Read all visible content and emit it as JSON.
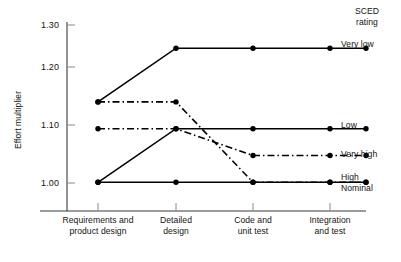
{
  "chart_data": {
    "type": "line",
    "title": "",
    "xlabel": "",
    "ylabel": "Effort multiplier",
    "categories": [
      "Requirements and product design",
      "Detailed design",
      "Code and unit test",
      "Integration and test"
    ],
    "x_tick_lines": [
      [
        "Requirements and",
        "product design"
      ],
      [
        "Detailed",
        "design"
      ],
      [
        "Code and",
        "unit test"
      ],
      [
        "Integration",
        "and test"
      ]
    ],
    "ylim": [
      0.955,
      1.315
    ],
    "y_ticks": [
      "1.00",
      "1.10",
      "1.20",
      "1.30"
    ],
    "y_tick_values": [
      1.0,
      1.1,
      1.2,
      1.3
    ],
    "grid": false,
    "legend_position": "right",
    "legend_title": [
      "SCED",
      "rating"
    ],
    "series": [
      {
        "name": "Very low",
        "style": "solid",
        "values": [
          1.15,
          1.25,
          1.25,
          1.25
        ],
        "label": "Very low"
      },
      {
        "name": "Low",
        "style": "solid",
        "values": [
          1.0,
          1.1,
          1.1,
          1.1
        ],
        "label": "Low"
      },
      {
        "name": "Very high",
        "style": "dash-dot",
        "values": [
          1.1,
          1.1,
          1.05,
          1.05
        ],
        "label": "Very high"
      },
      {
        "name": "High",
        "style": "dash-dot",
        "values": [
          1.15,
          1.15,
          1.0,
          1.0
        ],
        "label": "High"
      },
      {
        "name": "Nominal",
        "style": "solid",
        "values": [
          1.0,
          1.0,
          1.0,
          1.0
        ],
        "label": "Nominal"
      }
    ],
    "colors": {
      "line": "#000000",
      "axis": "#3a3a3a",
      "text": "#141414",
      "background": "#ffffff"
    }
  },
  "axis": {
    "y_label": "Effort multiplier",
    "y_tick_0": "1.00",
    "y_tick_1": "1.10",
    "y_tick_2": "1.20",
    "y_tick_3": "1.30"
  },
  "xaxis": {
    "t0_line1": "Requirements and",
    "t0_line2": "product design",
    "t1_line1": "Detailed",
    "t1_line2": "design",
    "t2_line1": "Code and",
    "t2_line2": "unit test",
    "t3_line1": "Integration",
    "t3_line2": "and test"
  },
  "legend": {
    "title_line1": "SCED",
    "title_line2": "rating",
    "very_low": "Very low",
    "low": "Low",
    "very_high": "Very high",
    "high": "High",
    "nominal": "Nominal"
  }
}
